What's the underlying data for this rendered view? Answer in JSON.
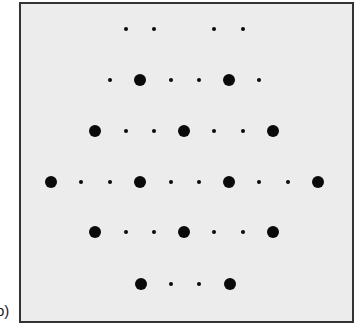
{
  "figure": {
    "panel_label": "b)",
    "frame": {
      "left": 19,
      "top": 2,
      "right": 352,
      "bottom": 321,
      "background": "#ececec",
      "border": "#333333"
    },
    "dot_color": "#0a0a0a",
    "rows": [
      {
        "y": 29,
        "dots": [
          {
            "x": 126,
            "size": "small"
          },
          {
            "x": 154,
            "size": "small"
          },
          {
            "x": 214,
            "size": "small"
          },
          {
            "x": 243,
            "size": "small"
          }
        ]
      },
      {
        "y": 80,
        "dots": [
          {
            "x": 110,
            "size": "small"
          },
          {
            "x": 140,
            "size": "big"
          },
          {
            "x": 171,
            "size": "small"
          },
          {
            "x": 199,
            "size": "small"
          },
          {
            "x": 229,
            "size": "big"
          },
          {
            "x": 259,
            "size": "small"
          }
        ]
      },
      {
        "y": 131,
        "dots": [
          {
            "x": 95,
            "size": "big"
          },
          {
            "x": 126,
            "size": "small"
          },
          {
            "x": 154,
            "size": "small"
          },
          {
            "x": 184,
            "size": "big"
          },
          {
            "x": 214,
            "size": "small"
          },
          {
            "x": 243,
            "size": "small"
          },
          {
            "x": 273,
            "size": "big"
          }
        ]
      },
      {
        "y": 182,
        "dots": [
          {
            "x": 51,
            "size": "big"
          },
          {
            "x": 81,
            "size": "small"
          },
          {
            "x": 110,
            "size": "small"
          },
          {
            "x": 140,
            "size": "big"
          },
          {
            "x": 171,
            "size": "small"
          },
          {
            "x": 199,
            "size": "small"
          },
          {
            "x": 229,
            "size": "big"
          },
          {
            "x": 259,
            "size": "small"
          },
          {
            "x": 288,
            "size": "small"
          },
          {
            "x": 318,
            "size": "big"
          }
        ]
      },
      {
        "y": 232,
        "dots": [
          {
            "x": 95,
            "size": "big"
          },
          {
            "x": 126,
            "size": "small"
          },
          {
            "x": 154,
            "size": "small"
          },
          {
            "x": 184,
            "size": "big"
          },
          {
            "x": 214,
            "size": "small"
          },
          {
            "x": 243,
            "size": "small"
          },
          {
            "x": 273,
            "size": "big"
          }
        ]
      },
      {
        "y": 284,
        "dots": [
          {
            "x": 141,
            "size": "big"
          },
          {
            "x": 171,
            "size": "small"
          },
          {
            "x": 199,
            "size": "small"
          },
          {
            "x": 230,
            "size": "big"
          }
        ]
      }
    ]
  }
}
